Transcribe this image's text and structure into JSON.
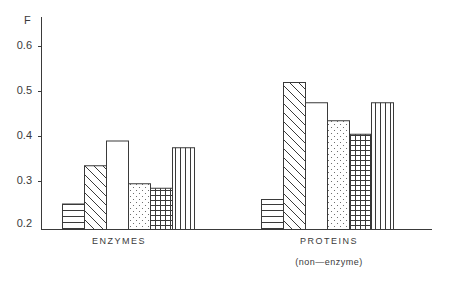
{
  "chart_data": {
    "type": "bar",
    "title": "",
    "xlabel": "",
    "ylabel": "F",
    "ylim": [
      0.2,
      0.65
    ],
    "yticks": [
      0.2,
      0.3,
      0.4,
      0.5,
      0.6
    ],
    "ytick_labels": [
      "0.2",
      "0.3",
      "0.4",
      "0.5",
      "0.6"
    ],
    "grid": false,
    "legend": null,
    "categories": [
      "ENZYMES",
      "PROTEINS"
    ],
    "category_sublabels": [
      "",
      "(non—enzyme)"
    ],
    "series": [
      {
        "name": "horizontal-hatch",
        "pattern": "horizontal",
        "values": [
          0.25,
          0.26
        ]
      },
      {
        "name": "diagonal-hatch",
        "pattern": "diagonal",
        "values": [
          0.335,
          0.52
        ]
      },
      {
        "name": "blank",
        "pattern": "none",
        "values": [
          0.39,
          0.475
        ]
      },
      {
        "name": "dotted",
        "pattern": "dots",
        "values": [
          0.295,
          0.435
        ]
      },
      {
        "name": "grid-hatch",
        "pattern": "grid",
        "values": [
          0.285,
          0.405
        ]
      },
      {
        "name": "vertical-hatch",
        "pattern": "vertical",
        "values": [
          0.375,
          0.475
        ]
      }
    ]
  },
  "axis": {
    "y_title": "F"
  },
  "labels": {
    "enzymes": "ENZYMES",
    "proteins": "PROTEINS",
    "proteins_sub": "(non—enzyme)"
  },
  "colors": {
    "line": "#3a3a3a",
    "background": "#ffffff"
  }
}
